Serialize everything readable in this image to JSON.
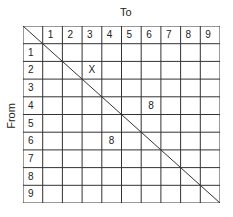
{
  "labels": {
    "to": "To",
    "from": "From"
  },
  "columns": [
    "1",
    "2",
    "3",
    "4",
    "5",
    "6",
    "7",
    "8",
    "9"
  ],
  "rows": [
    "1",
    "2",
    "3",
    "4",
    "5",
    "6",
    "7",
    "8",
    "9"
  ],
  "cells": [
    {
      "row": 2,
      "col": 3,
      "value": "X"
    },
    {
      "row": 4,
      "col": 6,
      "value": "8"
    },
    {
      "row": 6,
      "col": 4,
      "value": "8"
    }
  ],
  "diagonal": "top-left to bottom-right"
}
